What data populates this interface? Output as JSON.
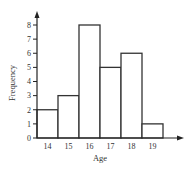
{
  "chart_data": {
    "type": "bar",
    "title": "",
    "xlabel": "Age",
    "ylabel": "Frequency",
    "categories": [
      "14",
      "15",
      "16",
      "17",
      "18",
      "19"
    ],
    "values": [
      2,
      3,
      8,
      5,
      6,
      1
    ],
    "yticks": [
      "0",
      "1",
      "2",
      "3",
      "4",
      "5",
      "6",
      "7",
      "8"
    ],
    "ylim": [
      0,
      8
    ],
    "grid": false,
    "legend": null,
    "style": "histogram (adjacent unfilled bars with dark outline)"
  },
  "colors": {
    "bar_stroke": "#333333",
    "bar_fill": "#ffffff",
    "axis": "#222222"
  }
}
